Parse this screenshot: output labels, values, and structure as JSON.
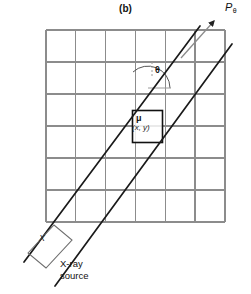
{
  "figure": {
    "panel_caption": "(b)"
  },
  "labels": {
    "projection": "P",
    "projection_subscript": "θ",
    "angle": "θ",
    "voxel_attenuation": "μ",
    "voxel_coordinates": "(x, y)",
    "source_box": "X",
    "source_caption_line1": "X-ray",
    "source_caption_line2": "source"
  },
  "colors": {
    "background": "#ffffff",
    "grid_line": "#8c8c8c",
    "beam_line": "#1a1a1a",
    "voxel_border": "#111111",
    "arrow": "#8c8c8c",
    "source_outline": "#6e6e6e",
    "text": "#1a1a1a"
  },
  "geometry": {
    "grid": {
      "x_left": 46,
      "y_top": 30,
      "x_right": 225,
      "y_bottom": 222,
      "columns": 6,
      "rows": 6,
      "cell_width": 29.8,
      "cell_height": 32.0,
      "x_positions": [
        46,
        75.8,
        105.6,
        135.4,
        165.2,
        195.0,
        225
      ],
      "y_positions": [
        30,
        62,
        94,
        126,
        158,
        190,
        222
      ]
    },
    "beam": {
      "angle_degrees": 48,
      "line_a": {
        "x1": 24,
        "y1": 262,
        "x2": 200,
        "y2": 26
      },
      "line_b": {
        "x1": 55,
        "y1": 286,
        "x2": 232,
        "y2": 44
      },
      "arrow": {
        "x1": 183,
        "y1": 56,
        "x2": 215,
        "y2": 20
      }
    },
    "voxel": {
      "x": 132,
      "y": 110,
      "width": 30,
      "height": 32
    },
    "angle_arc": {
      "center_x": 148,
      "center_y": 88,
      "radius": 22,
      "start_degrees": 0,
      "end_degrees": 48
    },
    "source_parallelogram": {
      "points": "28,253 54,225 72,240 46,268"
    }
  }
}
